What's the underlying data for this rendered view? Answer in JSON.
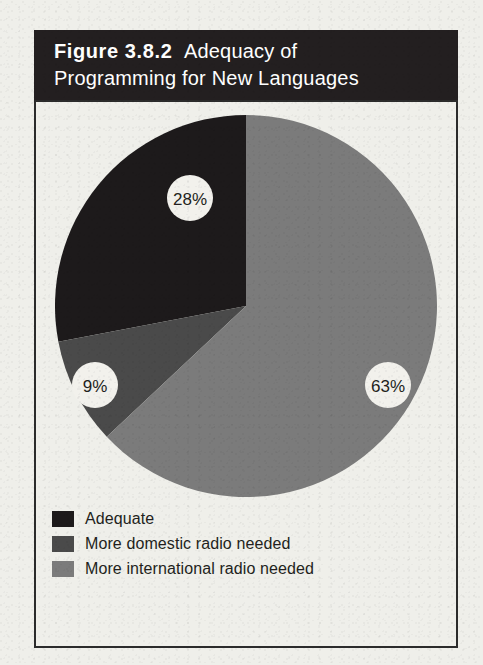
{
  "figure": {
    "banner": {
      "figure_label": "Figure 3.8.2",
      "title_line_1": "Adequacy of",
      "title_line_2": "Programming for New Languages",
      "background_color": "#231f20",
      "text_color": "#ffffff"
    },
    "frame_color": "#2b2b2b",
    "page_background": "#efefea"
  },
  "chart_data": {
    "type": "pie",
    "xlabel": "",
    "ylabel": "",
    "legend_position": "bottom-left",
    "grid": false,
    "start_angle_deg": 0,
    "direction": "clockwise",
    "categories": [
      "Adequate",
      "More domestic radio needed",
      "More international radio needed"
    ],
    "values": [
      28,
      9,
      63
    ],
    "value_labels": [
      "28%",
      "9%",
      "63%"
    ],
    "unit": "%",
    "colors": [
      "#1d1a1b",
      "#4a4a4a",
      "#7b7b7b"
    ],
    "slices": [
      {
        "label": "Adequate",
        "value": 28,
        "value_label": "28%",
        "color": "#1d1a1b",
        "badge_cx": 135,
        "badge_cy": 83,
        "badge_r": 23
      },
      {
        "label": "More domestic radio needed",
        "value": 9,
        "value_label": "9%",
        "color": "#4a4a4a",
        "badge_cx": 40,
        "badge_cy": 270,
        "badge_r": 23
      },
      {
        "label": "More international radio needed",
        "value": 63,
        "value_label": "63%",
        "color": "#7b7b7b",
        "badge_cx": 333,
        "badge_cy": 270,
        "badge_r": 23
      }
    ],
    "badge_fill": "#f2f1ec",
    "badge_text_color": "#231f20"
  },
  "legend": {
    "items": [
      {
        "label": "Adequate",
        "color": "#1d1a1b"
      },
      {
        "label": "More domestic radio needed",
        "color": "#4a4a4a"
      },
      {
        "label": "More international radio needed",
        "color": "#7b7b7b"
      }
    ]
  }
}
